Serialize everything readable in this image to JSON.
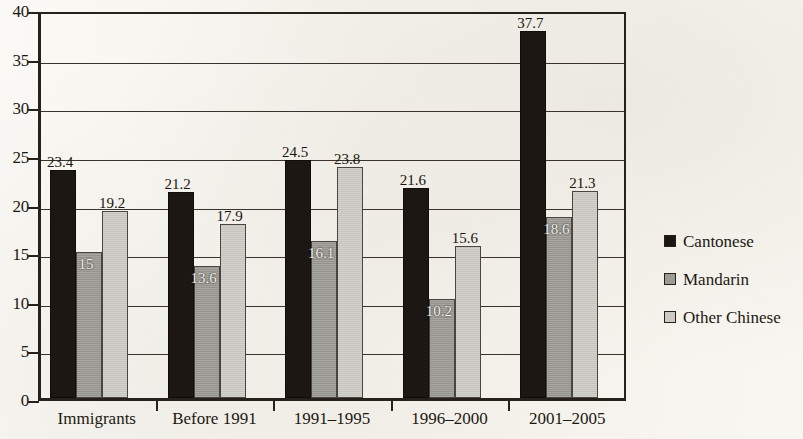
{
  "chart_data": {
    "type": "bar",
    "title": "",
    "subtitle": "",
    "xlabel": "",
    "ylabel": "",
    "categories": [
      "Immigrants",
      "Before 1991",
      "1991–1995",
      "1996–2000",
      "2001–2005"
    ],
    "series": [
      {
        "name": "Cantonese",
        "color": "#1c1712",
        "values": [
          23.4,
          21.2,
          24.5,
          21.6,
          37.7
        ]
      },
      {
        "name": "Mandarin",
        "color": "#9c9b95",
        "values": [
          15,
          13.6,
          16.1,
          10.2,
          18.6
        ]
      },
      {
        "name": "Other Chinese",
        "color": "#cbcac4",
        "values": [
          19.2,
          17.9,
          23.8,
          15.6,
          21.3
        ]
      }
    ],
    "value_labels": [
      [
        "23.4",
        "15",
        "19.2"
      ],
      [
        "21.2",
        "13.6",
        "17.9"
      ],
      [
        "24.5",
        "16.1",
        "23.8"
      ],
      [
        "21.6",
        "10.2",
        "15.6"
      ],
      [
        "37.7",
        "18.6",
        "21.3"
      ]
    ],
    "ylim": [
      0,
      40
    ],
    "yticks": [
      0,
      5,
      10,
      15,
      20,
      25,
      30,
      35,
      40
    ],
    "ytick_labels": [
      "0",
      "5",
      "10",
      "15",
      "20",
      "25",
      "30",
      "35",
      "40"
    ],
    "grid": true,
    "grid_axis": "y",
    "legend_position": "right",
    "legend": [
      "Cantonese",
      "Mandarin",
      "Other Chinese"
    ]
  }
}
